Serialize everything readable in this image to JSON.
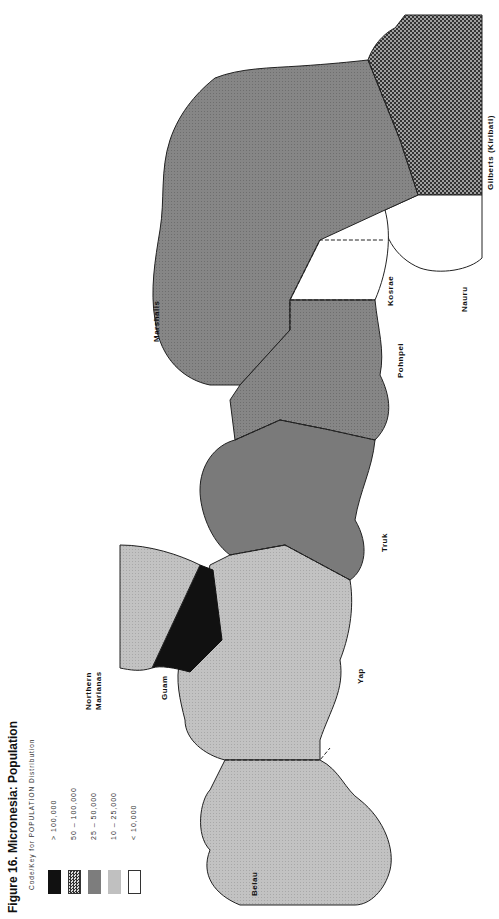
{
  "title": "Figure 16. Micronesia: Population",
  "legend": {
    "title": "Code/Key for POPULATION Distribution",
    "items": [
      {
        "range": ">   100,000",
        "fill": "black"
      },
      {
        "range": "50  –  100,000",
        "fill": "crosshatch"
      },
      {
        "range": "25  –  50,000",
        "fill": "dark-gray"
      },
      {
        "range": "10  –  25,000",
        "fill": "light-gray"
      },
      {
        "range": "<   10,000",
        "fill": "white"
      }
    ]
  },
  "colors": {
    "black": "#111111",
    "dark_gray": "#7d7d7d",
    "medium_gray": "#8e8e8e",
    "light_gray": "#bdbdbd",
    "white": "#ffffff",
    "crosshatch_bg": "#9a9a9a",
    "crosshatch_fg": "#3a3a3a",
    "outline": "#222222"
  },
  "regions": [
    {
      "name": "Belau",
      "label": "Belau",
      "class": "10 – 25,000"
    },
    {
      "name": "Yap",
      "label": "Yap",
      "class": "10 – 25,000"
    },
    {
      "name": "Guam",
      "label": "Guam",
      "class": "> 100,000"
    },
    {
      "name": "Northern Marianas",
      "label_line1": "Northern",
      "label_line2": "Marianas",
      "class": "10 – 25,000"
    },
    {
      "name": "Truk",
      "label": "Truk",
      "class": "25 – 50,000"
    },
    {
      "name": "Pohnpei",
      "label": "Pohnpei",
      "class": "25 – 50,000"
    },
    {
      "name": "Kosrae",
      "label": "Kosrae",
      "class": "< 10,000"
    },
    {
      "name": "Marshalls",
      "label": "Marshalls",
      "class": "25 – 50,000"
    },
    {
      "name": "Nauru",
      "label": "Nauru",
      "class": "< 10,000"
    },
    {
      "name": "Gilberts (Kiribati)",
      "label": "Gilberts (Kiribati)",
      "class": "50 – 100,000"
    }
  ]
}
